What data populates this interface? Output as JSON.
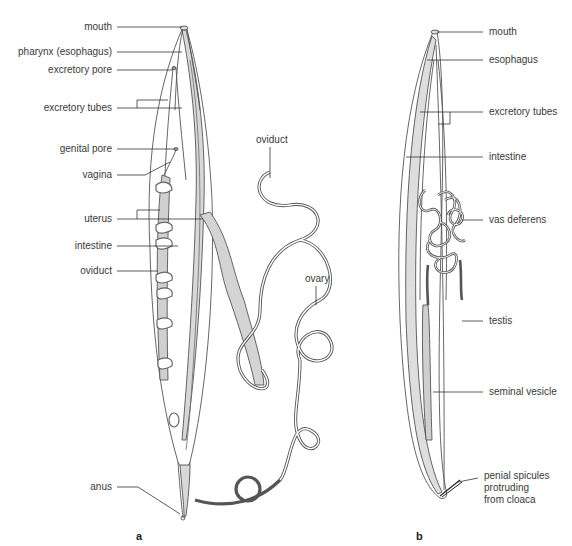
{
  "figure": {
    "panels": [
      {
        "id": "a",
        "letter": "a",
        "subject": "female",
        "labels": {
          "mouth": "mouth",
          "pharynx": "pharynx (esophagus)",
          "excretory_pore": "excretory pore",
          "excretory_tubes": "excretory tubes",
          "genital_pore": "genital pore",
          "vagina": "vagina",
          "uterus": "uterus",
          "intestine": "intestine",
          "oviduct_left": "oviduct",
          "oviduct_top": "oviduct",
          "ovary": "ovary",
          "anus": "anus"
        }
      },
      {
        "id": "b",
        "letter": "b",
        "subject": "male",
        "labels": {
          "mouth": "mouth",
          "esophagus": "esophagus",
          "excretory_tubes": "excretory tubes",
          "intestine": "intestine",
          "vas_deferens": "vas deferens",
          "testis": "testis",
          "seminal_vesicle": "seminal vesicle",
          "spicules_1": "penial spicules",
          "spicules_2": "protruding",
          "spicules_3": "from cloaca"
        }
      }
    ],
    "colors": {
      "outline": "#555555",
      "fill_gray": "#d4d4d4",
      "leader": "#333333",
      "text": "#3a3a3a"
    }
  }
}
